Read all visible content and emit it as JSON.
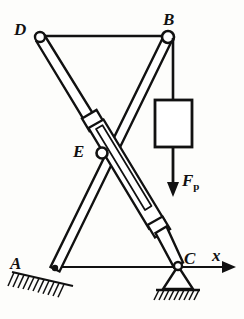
{
  "figure": {
    "background_color": "#fdfdfb",
    "line_color": "#111111"
  },
  "labels": {
    "a": "A",
    "b": "B",
    "c": "C",
    "d": "D",
    "e": "E",
    "x_axis": "x",
    "force_symbol": "F",
    "force_subscript": "p"
  },
  "joints": [
    {
      "name": "A",
      "x": 55,
      "y": 268,
      "type": "fixed-pin-support"
    },
    {
      "name": "B",
      "x": 168,
      "y": 37,
      "type": "pin-joint"
    },
    {
      "name": "C",
      "x": 178,
      "y": 265,
      "type": "pin-roller-support"
    },
    {
      "name": "D",
      "x": 40,
      "y": 38,
      "type": "pin-joint"
    },
    {
      "name": "E",
      "x": 102,
      "y": 153,
      "type": "cross-pivot"
    }
  ],
  "members": [
    {
      "name": "top-bar-DB",
      "from": "D",
      "to": "B",
      "kind": "thin-link"
    },
    {
      "name": "arm-BA",
      "from": "B",
      "to": "A",
      "kind": "thick-arm"
    },
    {
      "name": "cylinder-DC",
      "from": "D",
      "to": "C",
      "kind": "hydraulic-cylinder"
    },
    {
      "name": "base-AC",
      "from": "A",
      "to": "C",
      "kind": "thin-link"
    }
  ],
  "load": {
    "block": {
      "x": 155,
      "y": 100,
      "width": 37,
      "height": 47
    },
    "hanger_from_y": 37,
    "arrow_tip_y": 196,
    "label": "F",
    "subscript": "p"
  },
  "axis": {
    "name": "x",
    "from_x": 55,
    "to_x": 232,
    "y": 267,
    "arrow": "right"
  },
  "supports": {
    "a_hatch_count": 11,
    "c_hatch_count": 9
  }
}
